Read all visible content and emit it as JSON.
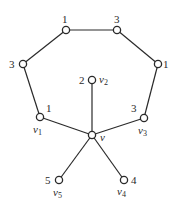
{
  "diagram": {
    "title": "",
    "nodes": [
      {
        "id": "a",
        "label": "",
        "weight": "1",
        "x": 66,
        "y": 30
      },
      {
        "id": "b",
        "label": "",
        "weight": "3",
        "x": 117,
        "y": 30
      },
      {
        "id": "c",
        "label": "",
        "weight": "3",
        "x": 23,
        "y": 64
      },
      {
        "id": "d",
        "label": "",
        "weight": "1",
        "x": 158,
        "y": 64
      },
      {
        "id": "v1",
        "label": "v",
        "sub": "1",
        "weight": "1",
        "x": 40,
        "y": 117
      },
      {
        "id": "v2",
        "label": "v",
        "sub": "2",
        "weight": "2",
        "x": 92,
        "y": 80
      },
      {
        "id": "v3",
        "label": "v",
        "sub": "3",
        "weight": "3",
        "x": 144,
        "y": 118
      },
      {
        "id": "v",
        "label": "v",
        "sub": "",
        "weight": "",
        "x": 92,
        "y": 135
      },
      {
        "id": "v4",
        "label": "v",
        "sub": "4",
        "weight": "4",
        "x": 124,
        "y": 180
      },
      {
        "id": "v5",
        "label": "v",
        "sub": "5",
        "weight": "5",
        "x": 59,
        "y": 180
      }
    ],
    "edges": [
      [
        "a",
        "b"
      ],
      [
        "a",
        "c"
      ],
      [
        "b",
        "d"
      ],
      [
        "c",
        "v1"
      ],
      [
        "d",
        "v3"
      ],
      [
        "v1",
        "v"
      ],
      [
        "v3",
        "v"
      ],
      [
        "v2",
        "v"
      ],
      [
        "v",
        "v4"
      ],
      [
        "v",
        "v5"
      ]
    ],
    "text": {
      "w_a": "1",
      "w_b": "3",
      "w_c": "3",
      "w_d": "1",
      "w_v1": "1",
      "w_v2": "2",
      "w_v3": "3",
      "w_v4": "4",
      "w_v5": "5",
      "v_main": "v",
      "v_sym": "v",
      "sub1": "1",
      "sub2": "2",
      "sub3": "3",
      "sub4": "4",
      "sub5": "5"
    }
  }
}
